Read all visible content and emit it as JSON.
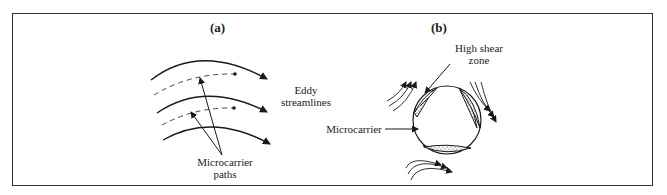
{
  "figure": {
    "panels": [
      {
        "id": "a",
        "label": "(a)",
        "annotations": {
          "eddy": "Eddy",
          "streamlines": "streamlines",
          "microcarrier": "Microcarrier",
          "paths": "paths"
        }
      },
      {
        "id": "b",
        "label": "(b)",
        "annotations": {
          "high_shear": "High shear",
          "zone": "zone",
          "microcarrier": "Microcarrier"
        }
      }
    ],
    "colors": {
      "line": "#1a1a1a",
      "border": "#333333",
      "background": "#ffffff"
    }
  }
}
